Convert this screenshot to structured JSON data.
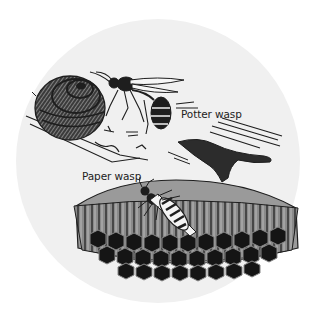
{
  "figure": {
    "background_color": "#ffffff",
    "circle_color": "#f0f0f0",
    "ink_color": "#1e1e1e",
    "labels": {
      "potter_wasp": "Potter wasp",
      "paper_wasp": "Paper wasp"
    }
  }
}
